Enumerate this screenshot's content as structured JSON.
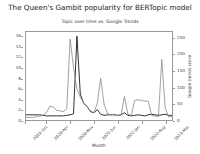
{
  "chart_data": {
    "type": "line",
    "title": "The Queen's Gambit popularity for BERTopic model",
    "subtitle": "Topic over time vs. Google Trends",
    "xlabel": "Month",
    "ylabel": "",
    "ylabel_right": "Google trends score",
    "grid": false,
    "legend_position": "none",
    "ylim": [
      0,
      17
    ],
    "ylim_right": [
      0,
      270
    ],
    "yticks": [
      0,
      2,
      4,
      6,
      8,
      10,
      12,
      14,
      16
    ],
    "yticks_right": [
      0,
      50,
      100,
      150,
      200,
      250
    ],
    "x": [
      "2019-Oct",
      "2019-Nov",
      "2019-Dec",
      "2020-Jan",
      "2020-Feb",
      "2020-Mar",
      "2020-Apr",
      "2020-May",
      "2020-Jun",
      "2020-Jul",
      "2020-Aug",
      "2020-Sep",
      "2020-Oct",
      "2020-Nov",
      "2020-Dec",
      "2021-Jan",
      "2021-Feb",
      "2021-Mar",
      "2021-Apr",
      "2021-May",
      "2021-Jun",
      "2021-Jul",
      "2021-Aug",
      "2021-Sep",
      "2021-Oct",
      "2021-Nov",
      "2021-Dec",
      "2022-Jan",
      "2022-Feb",
      "2022-Mar",
      "2022-Apr",
      "2022-May",
      "2022-Jun",
      "2022-Jul",
      "2022-Aug",
      "2022-Sep",
      "2022-Oct",
      "2022-Nov",
      "2022-Dec",
      "2023-Jan",
      "2023-Feb",
      "2023-Mar",
      "2023-Apr",
      "2023-May"
    ],
    "xticks_shown": [
      "2019-Oct",
      "2020-Apr",
      "2020-Nov",
      "2021-Jun",
      "2022-Jan",
      "2022-Aug",
      "2023-Mar"
    ],
    "series": [
      {
        "name": "Topic frequency",
        "axis": "left",
        "color": "#1a1a1a",
        "values": [
          1.0,
          1.0,
          1.0,
          1.0,
          1.0,
          0.9,
          0.8,
          0.8,
          0.8,
          0.8,
          0.8,
          0.8,
          0.9,
          1.0,
          1.2,
          16.2,
          5.0,
          3.2,
          2.6,
          1.6,
          1.4,
          2.0,
          1.1,
          0.9,
          1.0,
          1.0,
          1.0,
          0.9,
          1.0,
          1.4,
          0.9,
          0.8,
          0.9,
          1.0,
          0.9,
          0.8,
          1.0,
          1.1,
          1.0,
          0.9,
          1.0,
          1.1,
          0.9,
          0.9
        ]
      },
      {
        "name": "Google trends score",
        "axis": "right",
        "color": "#8a8a8a",
        "values": [
          8,
          8,
          8,
          10,
          12,
          14,
          22,
          42,
          40,
          30,
          28,
          26,
          34,
          248,
          160,
          96,
          70,
          52,
          40,
          28,
          22,
          52,
          128,
          48,
          20,
          16,
          18,
          14,
          16,
          72,
          18,
          14,
          60,
          62,
          60,
          58,
          58,
          14,
          12,
          10,
          186,
          36,
          10,
          10
        ]
      }
    ]
  }
}
